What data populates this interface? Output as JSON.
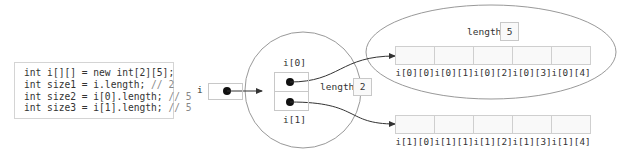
{
  "code": {
    "lines": [
      {
        "text": "int i[][] = new int[2][5];",
        "comment": ""
      },
      {
        "text": "int size1 = i.length;",
        "comment": " // 2"
      },
      {
        "text": "int size2 = i[0].length;",
        "comment": " // 5"
      },
      {
        "text": "int size3 = i[1].length;",
        "comment": " // 5"
      }
    ]
  },
  "variable": {
    "name": "i"
  },
  "outer_array": {
    "labels": [
      "i[0]",
      "i[1]"
    ],
    "length_label": "length",
    "length_value": "2"
  },
  "inner_arrays": [
    {
      "length_label": "length",
      "length_value": "5",
      "indices": [
        "i[0][0]",
        "i[0][1]",
        "i[0][2]",
        "i[0][3]",
        "i[0][4]"
      ]
    },
    {
      "indices": [
        "i[1][0]",
        "i[1][1]",
        "i[1][2]",
        "i[1][3]",
        "i[1][4]"
      ]
    }
  ]
}
